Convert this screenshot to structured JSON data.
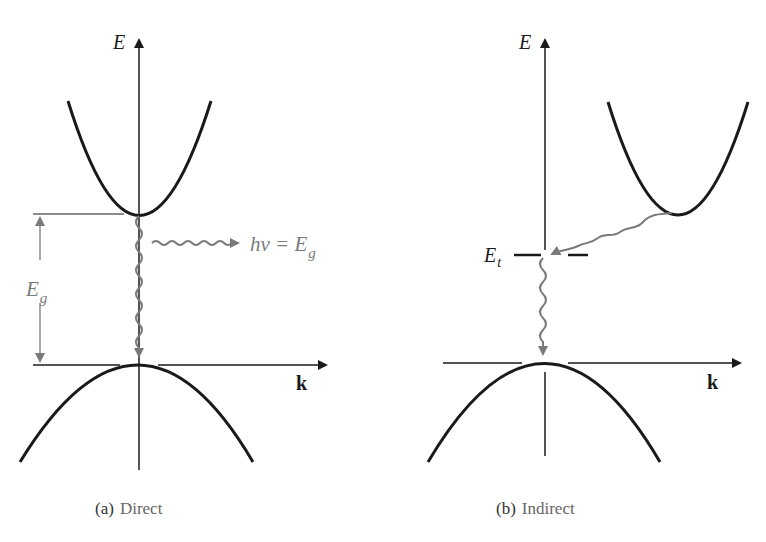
{
  "colors": {
    "ink": "#1a1a1a",
    "annotation": "#7a7a7a",
    "background": "#ffffff"
  },
  "panels": [
    {
      "id": "direct",
      "caption_tag": "(a)",
      "caption_text": "Direct",
      "energy_axis_label": "E",
      "k_axis_label": "k",
      "gap_label_main": "E",
      "gap_label_sub": "g",
      "photon_label_main": "hν = E",
      "photon_label_sub": "g"
    },
    {
      "id": "indirect",
      "caption_tag": "(b)",
      "caption_text": "Indirect",
      "energy_axis_label": "E",
      "k_axis_label": "k",
      "trap_label_main": "E",
      "trap_label_sub": "t"
    }
  ]
}
